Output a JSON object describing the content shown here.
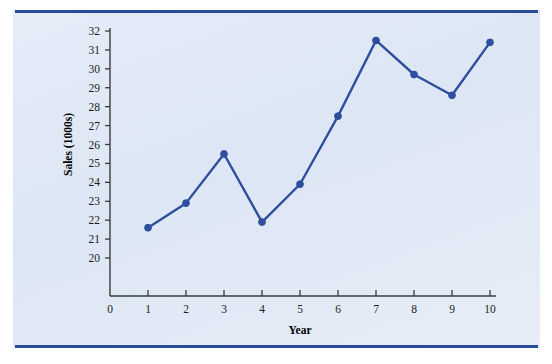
{
  "figure": {
    "background_color": "#ffffff",
    "panel_color": "#dde6f4",
    "rule_color": "#2a4b9b"
  },
  "chart_data": {
    "type": "line",
    "title": "",
    "subtitle": "",
    "xlabel": "Year",
    "ylabel": "Sales (1000s)",
    "x": [
      1,
      2,
      3,
      4,
      5,
      6,
      7,
      8,
      9,
      10
    ],
    "values": [
      21.6,
      22.9,
      25.5,
      21.9,
      23.9,
      27.5,
      31.5,
      29.7,
      28.6,
      31.4
    ],
    "series": [
      {
        "name": "Sales",
        "color": "#2d4f9e",
        "marker": "circle",
        "values": [
          21.6,
          22.9,
          25.5,
          21.9,
          23.9,
          27.5,
          31.5,
          29.7,
          28.6,
          31.4
        ]
      }
    ],
    "xlim": [
      0,
      10
    ],
    "ylim": [
      20,
      32
    ],
    "xticks": [
      "0",
      "1",
      "2",
      "3",
      "4",
      "5",
      "6",
      "7",
      "8",
      "9",
      "10"
    ],
    "yticks": [
      "20",
      "21",
      "22",
      "23",
      "24",
      "25",
      "26",
      "27",
      "28",
      "29",
      "30",
      "31",
      "32"
    ],
    "grid": false,
    "legend": false,
    "legend_position": "none",
    "annotations": []
  }
}
